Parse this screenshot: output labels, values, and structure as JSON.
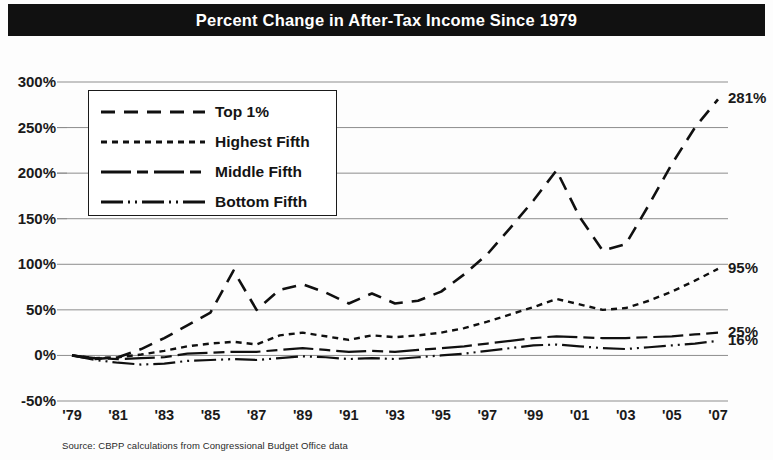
{
  "title": "Percent Change in After-Tax Income Since 1979",
  "source_note": "Source: CBPP calculations from Congressional Budget Office data",
  "legend": {
    "items": [
      {
        "label": "Top 1%",
        "dash": "14,9"
      },
      {
        "label": "Highest Fifth",
        "dash": "6,5"
      },
      {
        "label": "Middle Fifth",
        "dash": "30,6,11,6"
      },
      {
        "label": "Bottom Fifth",
        "dash": "22,5,2,5,2,5"
      }
    ]
  },
  "end_labels": [
    {
      "text": "281%",
      "series": "Top 1%"
    },
    {
      "text": "95%",
      "series": "Highest Fifth"
    },
    {
      "text": "25%",
      "series": "Middle Fifth"
    },
    {
      "text": "16%",
      "series": "Bottom Fifth"
    }
  ],
  "chart_data": {
    "type": "line",
    "title": "Percent Change in After-Tax Income Since 1979",
    "xlabel": "",
    "ylabel": "",
    "xlim": [
      1979,
      2007
    ],
    "ylim": [
      -50,
      300
    ],
    "ytick_labels": [
      "300%",
      "250%",
      "200%",
      "150%",
      "100%",
      "50%",
      "0%",
      "-50%"
    ],
    "ytick_values": [
      300,
      250,
      200,
      150,
      100,
      50,
      0,
      -50
    ],
    "xtick_labels": [
      "'79",
      "'81",
      "'83",
      "'85",
      "'87",
      "'89",
      "'91",
      "'93",
      "'95",
      "'97",
      "'99",
      "'01",
      "'03",
      "'05",
      "'07"
    ],
    "xtick_values": [
      1979,
      1981,
      1983,
      1985,
      1987,
      1989,
      1991,
      1993,
      1995,
      1997,
      1999,
      2001,
      2003,
      2005,
      2007
    ],
    "grid": true,
    "legend_position": "upper-left-inset",
    "x": [
      1979,
      1980,
      1981,
      1982,
      1983,
      1984,
      1985,
      1986,
      1987,
      1988,
      1989,
      1990,
      1991,
      1992,
      1993,
      1994,
      1995,
      1996,
      1997,
      1998,
      1999,
      2000,
      2001,
      2002,
      2003,
      2004,
      2005,
      2006,
      2007
    ],
    "series": [
      {
        "name": "Top 1%",
        "dash": "14,9",
        "end_label": "281%",
        "values": [
          0,
          -4,
          -2,
          7,
          19,
          33,
          47,
          93,
          50,
          72,
          78,
          69,
          57,
          68,
          57,
          60,
          70,
          89,
          111,
          140,
          170,
          203,
          152,
          115,
          122,
          165,
          210,
          250,
          281
        ]
      },
      {
        "name": "Highest Fifth",
        "dash": "6,5",
        "end_label": "95%",
        "values": [
          0,
          -3,
          -2,
          1,
          5,
          10,
          13,
          15,
          12,
          22,
          25,
          21,
          17,
          22,
          20,
          22,
          25,
          30,
          37,
          45,
          53,
          62,
          56,
          50,
          52,
          60,
          70,
          82,
          95
        ]
      },
      {
        "name": "Middle Fifth",
        "dash": "30,6,11,6",
        "end_label": "25%",
        "values": [
          0,
          -3,
          -4,
          -3,
          -2,
          2,
          3,
          4,
          4,
          6,
          8,
          6,
          4,
          5,
          4,
          6,
          8,
          10,
          13,
          16,
          19,
          21,
          20,
          19,
          19,
          20,
          21,
          23,
          25
        ]
      },
      {
        "name": "Bottom Fifth",
        "dash": "22,5,2,5,2,5",
        "end_label": "16%",
        "values": [
          0,
          -5,
          -8,
          -10,
          -9,
          -6,
          -5,
          -4,
          -5,
          -3,
          -1,
          -2,
          -4,
          -3,
          -4,
          -2,
          0,
          2,
          5,
          8,
          11,
          12,
          10,
          8,
          7,
          9,
          11,
          13,
          16
        ]
      }
    ]
  }
}
